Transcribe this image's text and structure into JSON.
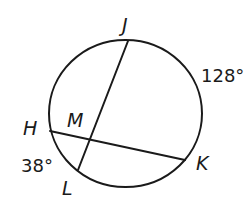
{
  "diagram": {
    "type": "circle-intersecting-chords",
    "circle": {
      "cx": 125.5,
      "cy": 113.5,
      "rx": 76.5,
      "ry": 73.5
    },
    "points": {
      "J": {
        "label": "J",
        "x": 128,
        "y": 41
      },
      "L": {
        "label": "L",
        "x": 78,
        "y": 170
      },
      "H": {
        "label": "H",
        "x": 50,
        "y": 131
      },
      "K": {
        "label": "K",
        "x": 185,
        "y": 160
      },
      "M": {
        "label": "M",
        "x": 90,
        "y": 139
      }
    },
    "chords": [
      {
        "name": "JL",
        "from": "J",
        "to": "L"
      },
      {
        "name": "HK",
        "from": "H",
        "to": "K"
      }
    ],
    "arcs": [
      {
        "name": "arc-JK",
        "measure": "128°"
      },
      {
        "name": "arc-HL",
        "measure": "38°"
      }
    ],
    "labels": {
      "J": "J",
      "M": "M",
      "H": "H",
      "K": "K",
      "L": "L",
      "arc_JK": "128°",
      "arc_HL": "38°"
    }
  }
}
